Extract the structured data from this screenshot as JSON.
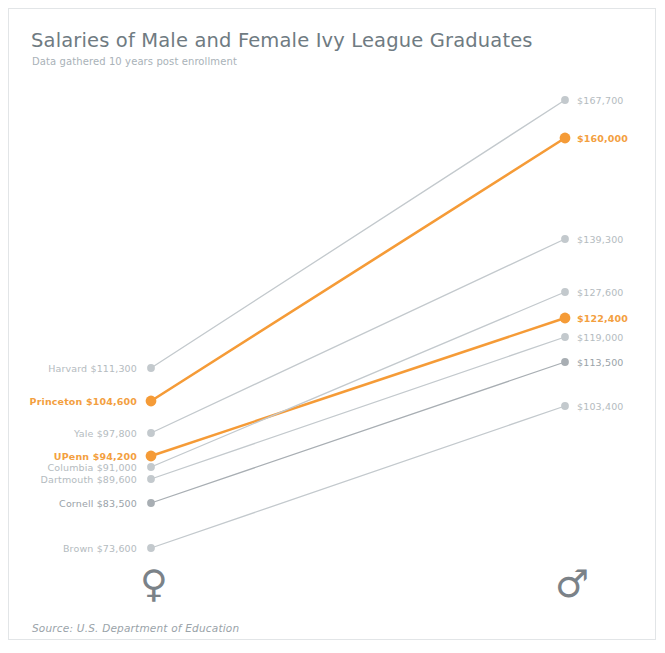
{
  "chart_data": {
    "type": "line",
    "title": "Salaries of Male and Female Ivy League Graduates",
    "subtitle": "Data gathered 10 years post enrollment",
    "source": "Source: U.S. Department of Education",
    "xlabel": "",
    "ylabel": "",
    "categories": [
      "Female",
      "Male"
    ],
    "category_symbols": [
      "♀",
      "♂"
    ],
    "grid": false,
    "legend": "none",
    "ylim": [
      70000,
      172000
    ],
    "value_prefix": "$",
    "series": [
      {
        "name": "Harvard",
        "highlight": false,
        "color": "#c3c9cd",
        "values": [
          111300,
          167700
        ],
        "left_label": "Harvard  $111,300",
        "right_label": "$167,700",
        "left_y": 367,
        "right_y": 99
      },
      {
        "name": "Princeton",
        "highlight": true,
        "color": "#f59b37",
        "values": [
          104600,
          160000
        ],
        "left_label": "Princeton  $104,600",
        "right_label": "$160,000",
        "left_y": 400,
        "right_y": 137
      },
      {
        "name": "Yale",
        "highlight": false,
        "color": "#c3c9cd",
        "values": [
          97800,
          139300
        ],
        "left_label": "Yale  $97,800",
        "right_label": "$139,300",
        "left_y": 432,
        "right_y": 238
      },
      {
        "name": "UPenn",
        "highlight": true,
        "color": "#f59b37",
        "values": [
          94200,
          122400
        ],
        "left_label": "UPenn  $94,200",
        "right_label": "$122,400",
        "left_y": 455,
        "right_y": 317
      },
      {
        "name": "Columbia",
        "highlight": false,
        "color": "#c3c9cd",
        "values": [
          91000,
          127600
        ],
        "left_label": "Columbia  $91,000",
        "right_label": "$127,600",
        "left_y": 466,
        "right_y": 291
      },
      {
        "name": "Dartmouth",
        "highlight": false,
        "color": "#c3c9cd",
        "values": [
          89600,
          119000
        ],
        "left_label": "Dartmouth  $89,600",
        "right_label": "$119,000",
        "left_y": 478,
        "right_y": 336
      },
      {
        "name": "Cornell",
        "highlight": false,
        "color": "#a8aeb3",
        "values": [
          83500,
          113500
        ],
        "left_label": "Cornell  $83,500",
        "right_label": "$113,500",
        "left_y": 502,
        "right_y": 361
      },
      {
        "name": "Brown",
        "highlight": false,
        "color": "#c3c9cd",
        "values": [
          73600,
          103400
        ],
        "left_label": "Brown  $73,600",
        "right_label": "$103,400",
        "left_y": 547,
        "right_y": 405
      }
    ],
    "colors": {
      "accent": "#f59b37",
      "muted_line": "#c3c9cd",
      "muted_line_dark": "#a8aeb3",
      "title": "#6f7b82",
      "subtitle": "#a9b2b8",
      "label": "#b4bbc0",
      "border": "#e2e5e7",
      "background": "#ffffff"
    }
  },
  "icons": {
    "female": "female-symbol-icon",
    "male": "male-symbol-icon"
  }
}
